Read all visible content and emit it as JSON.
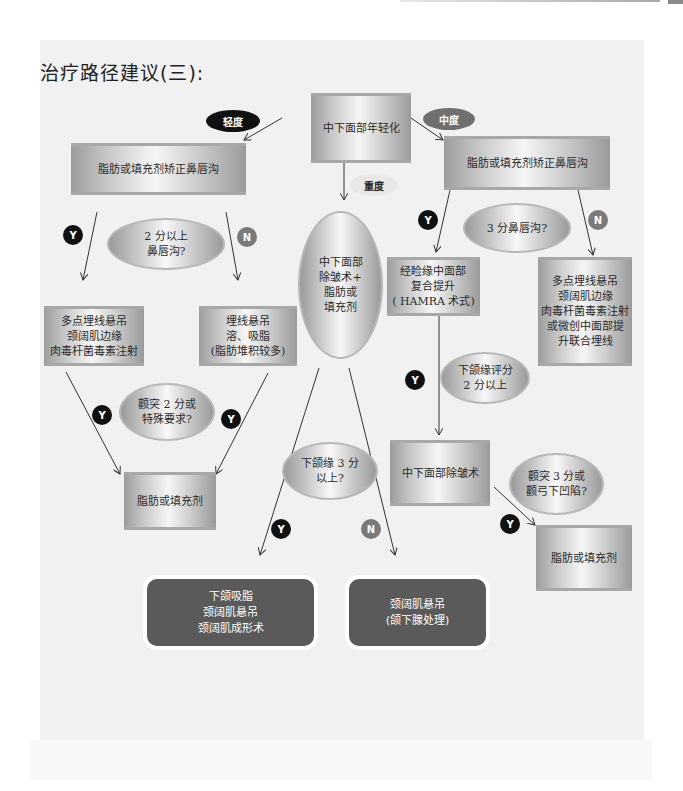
{
  "title": "治疗路径建议(三):",
  "root": "中下面部年轻化",
  "severity": {
    "mild": "轻度",
    "moderate": "中度",
    "severe": "重度"
  },
  "branch_labels": {
    "yes": "Y",
    "no": "N"
  },
  "mild_branch": {
    "first_step": "脂肪或填充剂矫正鼻唇沟",
    "question_1": "2 分以上\n鼻唇沟?",
    "yes_result": "多点埋线悬吊\n颈阔肌边缘\n肉毒杆菌毒素注射",
    "no_result": "埋线悬吊\n溶、吸脂\n(脂肪堆积较多)",
    "question_2": "颧突 2 分或\n特殊要求?",
    "final": "脂肪或填充剂"
  },
  "severe_branch": {
    "step": "中下面部\n除皱术+\n脂肪或\n填充剂",
    "question": "下颌缘 3 分\n以上?",
    "yes_result": "下颌吸脂\n颈阔肌悬吊\n颈阔肌成形术",
    "no_result": "颈阔肌悬吊\n(颌下腺处理)"
  },
  "moderate_branch": {
    "first_step": "脂肪或填充剂矫正鼻唇沟",
    "question_1": "3 分鼻唇沟?",
    "yes_result": "经睑缘中面部\n复合提升\n( HAMRA 术式)",
    "no_result": "多点埋线悬吊\n颈阔肌边缘\n肉毒杆菌毒素注射\n或微创中面部提\n升联合埋线",
    "question_2": "下颌缘评分\n2 分以上",
    "step_2": "中下面部除皱术",
    "question_3": "颧突 3 分或\n颧弓下凹陷?",
    "final": "脂肪或填充剂"
  },
  "colors": {
    "panel": "#f1f1f1",
    "result_box": "#5a5a5a",
    "yes_badge": "#111111",
    "no_badge": "#7a7a7a"
  }
}
